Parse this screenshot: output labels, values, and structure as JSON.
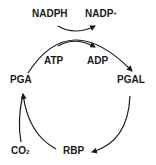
{
  "diagram": {
    "nodes": {
      "nadph": "NADPH",
      "nadp_base": "NADP",
      "nadp_sup": "+",
      "atp": "ATP",
      "adp": "ADP",
      "pga": "PGA",
      "pgal": "PGAL",
      "rbp": "RBP",
      "co2_base": "CO",
      "co2_sub": "2"
    },
    "edges": [
      {
        "from": "PGA",
        "to": "PGAL",
        "via": [
          "ATP→ADP",
          "NADPH→NADP+"
        ]
      },
      {
        "from": "PGAL",
        "to": "RBP"
      },
      {
        "from": "RBP",
        "to": "PGA"
      },
      {
        "from": "CO2",
        "to": "PGA"
      }
    ],
    "colors": {
      "ink": "#1a1a1a",
      "background": "#ffffff"
    }
  }
}
